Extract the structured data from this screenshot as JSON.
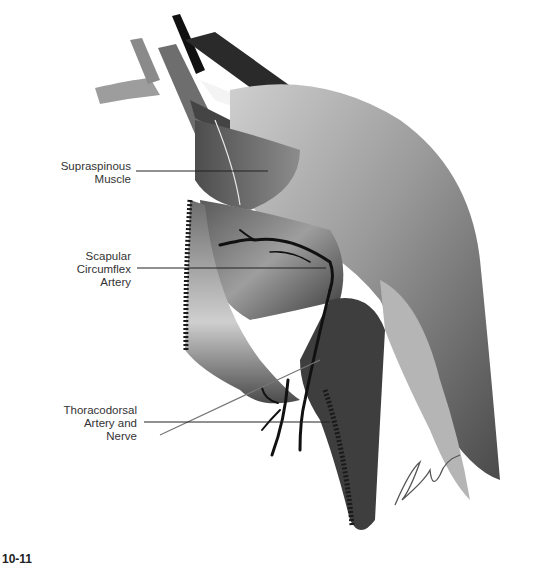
{
  "figure": {
    "type": "anatomical-illustration",
    "colors": {
      "background": "#ffffff",
      "muscle_dark": "#3a3a3a",
      "muscle_mid": "#8a8a8a",
      "muscle_light": "#d8d8d8",
      "vessel": "#111111",
      "label_text": "#333333",
      "leader_line": "#222222"
    }
  },
  "labels": [
    {
      "id": "supraspinous",
      "lines": [
        "Supraspinous",
        "Muscle"
      ]
    },
    {
      "id": "scapular-circumflex",
      "lines": [
        "Scapular",
        "Circumflex",
        "Artery"
      ]
    },
    {
      "id": "thoracodorsal",
      "lines": [
        "Thoracodorsal",
        "Artery and",
        "Nerve"
      ]
    }
  ],
  "caption": {
    "visible_text": "10-11"
  }
}
